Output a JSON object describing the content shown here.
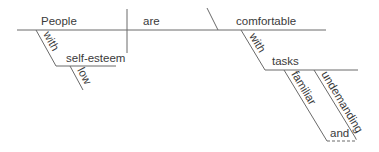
{
  "diagram": {
    "type": "Reed-Kellogg sentence diagram",
    "sentence_words": {
      "subject": "People",
      "verb": "are",
      "predicate_adjective": "comfortable",
      "subject_modifier_preposition": "with",
      "subject_modifier_object": "self-esteem",
      "object_modifier_1": "low",
      "predicate_modifier_preposition": "with",
      "predicate_modifier_object": "tasks",
      "task_modifier_1": "familiar",
      "task_modifier_2": "undemanding",
      "conjunction": "and"
    },
    "colors": {
      "line": "#6a6a6a",
      "text": "#3a3a3a",
      "background": "#ffffff"
    }
  }
}
